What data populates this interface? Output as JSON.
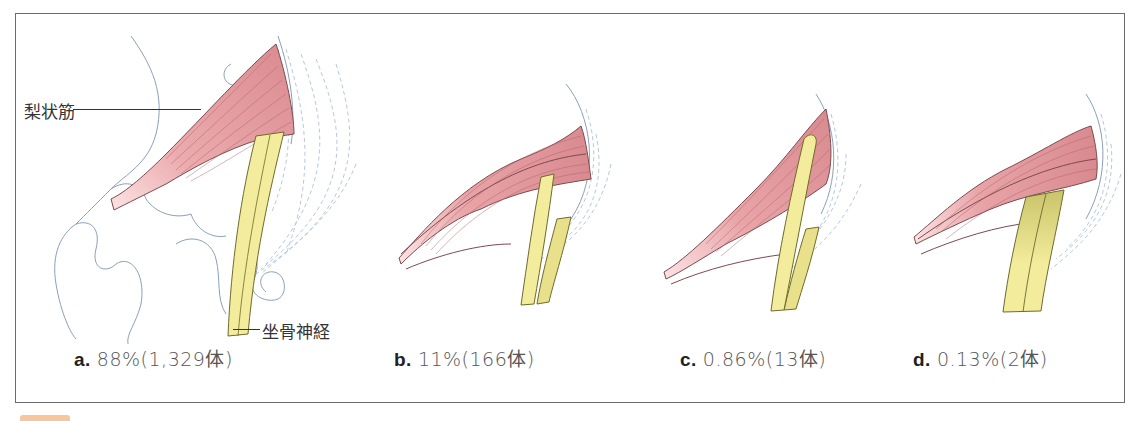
{
  "figure": {
    "labels": {
      "muscle": "梨状筋",
      "nerve": "坐骨神経"
    },
    "panels": [
      {
        "letter": "a.",
        "value": "88%(1,329体)"
      },
      {
        "letter": "b.",
        "value": "11%(166体)"
      },
      {
        "letter": "c.",
        "value": "0.86%(13体)"
      },
      {
        "letter": "d.",
        "value": "0.13%(2体)"
      }
    ],
    "colors": {
      "muscle": "#e7a3a6",
      "muscle_line": "#9c5a5e",
      "nerve": "#f2ec9c",
      "nerve_shade": "#c9c46a",
      "bone_line": "#8aa0b8",
      "ligament": "#b8c8dc",
      "frame": "#6b6b6b",
      "tab": "#f6c79a"
    }
  }
}
